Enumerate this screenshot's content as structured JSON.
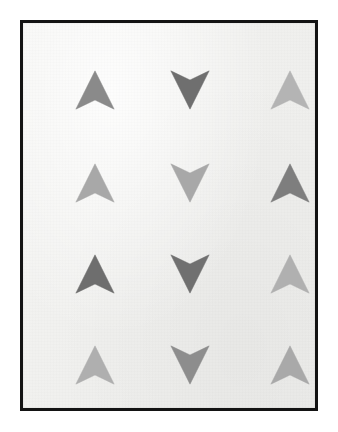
{
  "poster": {
    "title": "Arrow Grid",
    "frame_color": "#131313",
    "frame_border_width_px": 3,
    "canvas_color": "#f2f2f0",
    "page_background": "#ffffff",
    "columns": 3,
    "rows": 4
  },
  "chart_data": {
    "type": "heatmap",
    "subtitle": "",
    "xlabel": "",
    "ylabel": "",
    "grid": false,
    "legend": "none",
    "categories": [
      "Column 1",
      "Column 2",
      "Column 3"
    ],
    "row_labels": [
      "Row 1",
      "Row 2",
      "Row 3",
      "Row 4"
    ],
    "value_key": "gray_level_0_to_255",
    "cells": [
      {
        "row": 1,
        "col": 1,
        "direction": "up",
        "color": "#8a8a8a",
        "value": 138,
        "cx": 75,
        "cy": 70
      },
      {
        "row": 1,
        "col": 2,
        "direction": "down",
        "color": "#6f6f6f",
        "value": 111,
        "cx": 170,
        "cy": 70
      },
      {
        "row": 1,
        "col": 3,
        "direction": "up",
        "color": "#b4b4b4",
        "value": 180,
        "cx": 270,
        "cy": 70
      },
      {
        "row": 2,
        "col": 1,
        "direction": "up",
        "color": "#a8a8a8",
        "value": 168,
        "cx": 75,
        "cy": 163
      },
      {
        "row": 2,
        "col": 2,
        "direction": "down",
        "color": "#a8a8a8",
        "value": 168,
        "cx": 170,
        "cy": 163
      },
      {
        "row": 2,
        "col": 3,
        "direction": "up",
        "color": "#7e7e7e",
        "value": 126,
        "cx": 270,
        "cy": 163
      },
      {
        "row": 3,
        "col": 1,
        "direction": "up",
        "color": "#6e6e6e",
        "value": 110,
        "cx": 75,
        "cy": 254
      },
      {
        "row": 3,
        "col": 2,
        "direction": "down",
        "color": "#707070",
        "value": 112,
        "cx": 170,
        "cy": 254
      },
      {
        "row": 3,
        "col": 3,
        "direction": "up",
        "color": "#b0b0b0",
        "value": 176,
        "cx": 270,
        "cy": 254
      },
      {
        "row": 4,
        "col": 1,
        "direction": "up",
        "color": "#afafaf",
        "value": 175,
        "cx": 75,
        "cy": 345
      },
      {
        "row": 4,
        "col": 2,
        "direction": "down",
        "color": "#8d8d8d",
        "value": 141,
        "cx": 170,
        "cy": 345
      },
      {
        "row": 4,
        "col": 3,
        "direction": "up",
        "color": "#a9a9a9",
        "value": 169,
        "cx": 270,
        "cy": 345
      }
    ],
    "arrow_size": {
      "width": 42,
      "height": 40
    }
  }
}
